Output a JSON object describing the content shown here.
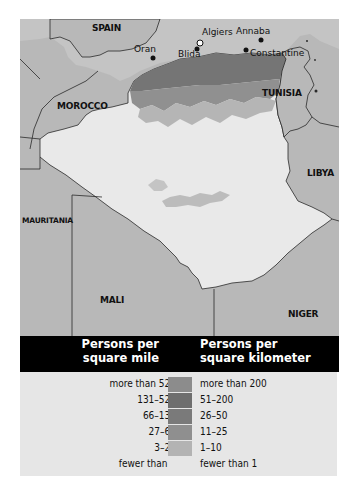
{
  "map": {
    "countries": [
      {
        "name": "SPAIN"
      },
      {
        "name": "MOROCCO"
      },
      {
        "name": "TUNISIA"
      },
      {
        "name": "LIBYA"
      },
      {
        "name": "MAURITANIA"
      },
      {
        "name": "MALI"
      },
      {
        "name": "NIGER"
      }
    ],
    "cities": [
      {
        "name": "Algiers",
        "type": "capital"
      },
      {
        "name": "Oran",
        "type": "city"
      },
      {
        "name": "Blida",
        "type": "city"
      },
      {
        "name": "Annaba",
        "type": "city"
      },
      {
        "name": "Constantine",
        "type": "city"
      }
    ],
    "colors": {
      "neighbor": "#b4b4b4",
      "sea": "#c8c8c8",
      "algeria_base": "#e9e9e9",
      "border": "#2a2a2a"
    }
  },
  "legend": {
    "header_mile": [
      "Persons per",
      "square mile"
    ],
    "header_km": [
      "Persons per",
      "square kilometer"
    ],
    "rows": [
      {
        "mile": "more than 520",
        "km": "more than 200",
        "color": "#8c8c8c"
      },
      {
        "mile": "131–520",
        "km": "51–200",
        "color": "#6e6e6e"
      },
      {
        "mile": "66–130",
        "km": "26–50",
        "color": "#7a7a7a"
      },
      {
        "mile": "27–65",
        "km": "11–25",
        "color": "#8f8f8f"
      },
      {
        "mile": "3–26",
        "km": "1–10",
        "color": "#b3b3b3"
      },
      {
        "mile": "fewer than 3",
        "km": "fewer than 1",
        "color": "#e6e6e6"
      }
    ]
  }
}
